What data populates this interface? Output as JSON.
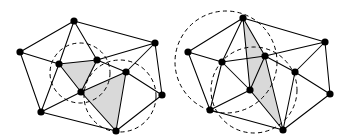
{
  "figure": {
    "canvas": {
      "width": 348,
      "height": 140,
      "background": "#ffffff"
    },
    "style": {
      "edge_color": "#000000",
      "vertex_color": "#000000",
      "shaded_face_color": "#d9d9d9",
      "circle_stroke": "#000000",
      "circle_dash": "4.2 3.2"
    },
    "panels": [
      {
        "id": "left-panel",
        "name": "before-flip",
        "vertices": [
          {
            "id": "L0",
            "x": 74,
            "y": 21
          },
          {
            "id": "L1",
            "x": 20,
            "y": 52
          },
          {
            "id": "L2",
            "x": 155,
            "y": 43
          },
          {
            "id": "L3",
            "x": 59,
            "y": 64
          },
          {
            "id": "L4",
            "x": 97,
            "y": 60
          },
          {
            "id": "L5",
            "x": 126,
            "y": 72
          },
          {
            "id": "L6",
            "x": 81,
            "y": 92
          },
          {
            "id": "L7",
            "x": 41,
            "y": 112
          },
          {
            "id": "L8",
            "x": 116,
            "y": 131
          },
          {
            "id": "L9",
            "x": 162,
            "y": 95
          }
        ],
        "edges": [
          [
            "L0",
            "L1"
          ],
          [
            "L0",
            "L2"
          ],
          [
            "L0",
            "L3"
          ],
          [
            "L0",
            "L4"
          ],
          [
            "L1",
            "L3"
          ],
          [
            "L1",
            "L7"
          ],
          [
            "L2",
            "L4"
          ],
          [
            "L2",
            "L5"
          ],
          [
            "L2",
            "L9"
          ],
          [
            "L3",
            "L4"
          ],
          [
            "L3",
            "L6"
          ],
          [
            "L3",
            "L7"
          ],
          [
            "L4",
            "L5"
          ],
          [
            "L4",
            "L6"
          ],
          [
            "L5",
            "L6"
          ],
          [
            "L5",
            "L8"
          ],
          [
            "L5",
            "L9"
          ],
          [
            "L6",
            "L7"
          ],
          [
            "L6",
            "L8"
          ],
          [
            "L7",
            "L8"
          ],
          [
            "L8",
            "L9"
          ]
        ],
        "shaded_faces": [
          [
            "L3",
            "L4",
            "L6"
          ],
          [
            "L6",
            "L5",
            "L8"
          ]
        ],
        "circumcircles": [
          {
            "cx": 80,
            "cy": 73,
            "r": 30
          },
          {
            "cx": 120,
            "cy": 96,
            "r": 36
          }
        ]
      },
      {
        "id": "right-panel",
        "name": "after-flip",
        "vertices": [
          {
            "id": "R0",
            "x": 243,
            "y": 18
          },
          {
            "id": "R1",
            "x": 188,
            "y": 52
          },
          {
            "id": "R2",
            "x": 325,
            "y": 42
          },
          {
            "id": "R3",
            "x": 222,
            "y": 62
          },
          {
            "id": "R4",
            "x": 265,
            "y": 56
          },
          {
            "id": "R5",
            "x": 295,
            "y": 72
          },
          {
            "id": "R6",
            "x": 250,
            "y": 90
          },
          {
            "id": "R7",
            "x": 210,
            "y": 110
          },
          {
            "id": "R8",
            "x": 283,
            "y": 130
          },
          {
            "id": "R9",
            "x": 330,
            "y": 94
          }
        ],
        "edges": [
          [
            "R0",
            "R1"
          ],
          [
            "R0",
            "R2"
          ],
          [
            "R0",
            "R3"
          ],
          [
            "R0",
            "R4"
          ],
          [
            "R0",
            "R6"
          ],
          [
            "R1",
            "R3"
          ],
          [
            "R1",
            "R7"
          ],
          [
            "R2",
            "R4"
          ],
          [
            "R2",
            "R5"
          ],
          [
            "R2",
            "R9"
          ],
          [
            "R3",
            "R4"
          ],
          [
            "R3",
            "R6"
          ],
          [
            "R3",
            "R7"
          ],
          [
            "R4",
            "R5"
          ],
          [
            "R4",
            "R6"
          ],
          [
            "R4",
            "R8"
          ],
          [
            "R5",
            "R8"
          ],
          [
            "R5",
            "R9"
          ],
          [
            "R6",
            "R7"
          ],
          [
            "R6",
            "R8"
          ],
          [
            "R7",
            "R8"
          ],
          [
            "R8",
            "R9"
          ]
        ],
        "shaded_faces": [
          [
            "R0",
            "R4",
            "R6"
          ],
          [
            "R4",
            "R6",
            "R8"
          ]
        ],
        "circumcircles": [
          {
            "cx": 226,
            "cy": 62,
            "r": 51
          },
          {
            "cx": 254,
            "cy": 90,
            "r": 43
          }
        ]
      }
    ]
  }
}
